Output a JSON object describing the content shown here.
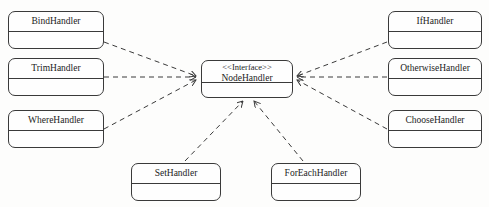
{
  "diagram": {
    "type": "uml-class-diagram",
    "background_color": "#fdfdfc",
    "line_color": "#3a3a3a",
    "relationship": "realization",
    "line_style": "dashed",
    "arrowhead": "open"
  },
  "interface": {
    "stereotype": "<<Interface>>",
    "name": "NodeHandler"
  },
  "classes": {
    "bind": {
      "name": "BindHandler"
    },
    "trim": {
      "name": "TrimHandler"
    },
    "where": {
      "name": "WhereHandler"
    },
    "if": {
      "name": "IfHandler"
    },
    "otherwise": {
      "name": "OtherwiseHandler"
    },
    "choose": {
      "name": "ChooseHandler"
    },
    "set": {
      "name": "SetHandler"
    },
    "foreach": {
      "name": "ForEachHandler"
    }
  }
}
